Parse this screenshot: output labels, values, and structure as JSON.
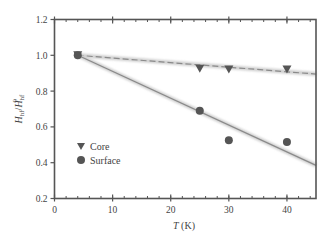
{
  "chart_data": {
    "type": "scatter",
    "title": "",
    "xlabel": "T (K)",
    "ylabel": "H_hf/H_hf^0",
    "xlim": [
      0,
      45
    ],
    "ylim": [
      0.2,
      1.2
    ],
    "x_ticks": [
      0,
      10,
      20,
      30,
      40
    ],
    "x_tick_labels": [
      "0",
      "10",
      "20",
      "30",
      "40"
    ],
    "y_ticks": [
      0.2,
      0.4,
      0.6,
      0.8,
      1.0,
      1.2
    ],
    "y_tick_labels": [
      "0.2",
      "0.4",
      "0.6",
      "0.8",
      "1.0",
      "1.2"
    ],
    "x_minor_step": 2,
    "grid": false,
    "legend_position": "lower-left inside",
    "series": [
      {
        "name": "Core",
        "marker": "triangle-down",
        "color": "#555555",
        "x": [
          4,
          25,
          30,
          40
        ],
        "y": [
          1.0,
          0.925,
          0.92,
          0.92
        ],
        "fit_line": {
          "style": "dashed",
          "color": "#8a8a8a",
          "x": [
            4,
            45
          ],
          "y": [
            1.0,
            0.895
          ]
        }
      },
      {
        "name": "Surface",
        "marker": "circle",
        "color": "#555555",
        "x": [
          4,
          25,
          30,
          40
        ],
        "y": [
          1.0,
          0.69,
          0.525,
          0.515
        ],
        "fit_line": {
          "style": "solid",
          "color": "#8a8a8a",
          "x": [
            4,
            45
          ],
          "y": [
            1.0,
            0.385
          ]
        }
      }
    ]
  },
  "labels": {
    "xlabel_italic": "T",
    "xlabel_unit": " (K)",
    "ylabel_main": "H",
    "ylabel_sub": "hf",
    "ylabel_slash": "/",
    "ylabel_sup": "0",
    "legend_core": "Core",
    "legend_surface": "Surface"
  }
}
